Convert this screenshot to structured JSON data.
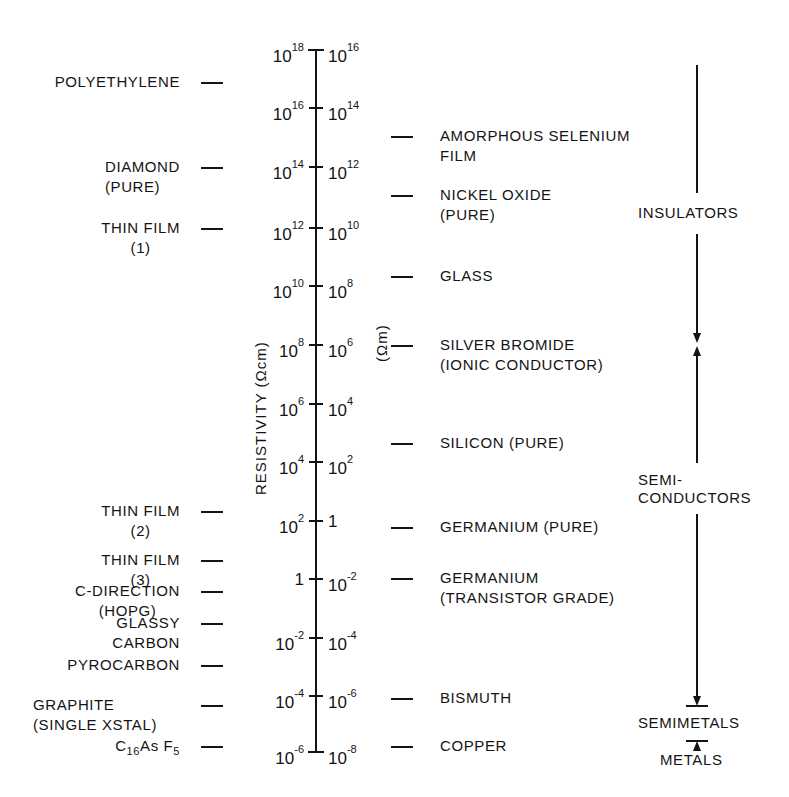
{
  "axis": {
    "title_left": "RESISTIVITY (Ωcm)",
    "title_right": "(Ωm)",
    "ticks": [
      {
        "left": "10",
        "left_exp": "18",
        "right": "10",
        "right_exp": "16",
        "y": 50
      },
      {
        "left": "10",
        "left_exp": "16",
        "right": "10",
        "right_exp": "14",
        "y": 108
      },
      {
        "left": "10",
        "left_exp": "14",
        "right": "10",
        "right_exp": "12",
        "y": 167
      },
      {
        "left": "10",
        "left_exp": "12",
        "right": "10",
        "right_exp": "10",
        "y": 228
      },
      {
        "left": "10",
        "left_exp": "10",
        "right": "10",
        "right_exp": "8",
        "y": 286
      },
      {
        "left": "10",
        "left_exp": "8",
        "right": "10",
        "right_exp": "6",
        "y": 345
      },
      {
        "left": "10",
        "left_exp": "6",
        "right": "10",
        "right_exp": "4",
        "y": 404
      },
      {
        "left": "10",
        "left_exp": "4",
        "right": "10",
        "right_exp": "2",
        "y": 462
      },
      {
        "left": "10",
        "left_exp": "2",
        "right": "1",
        "right_exp": "",
        "y": 521
      },
      {
        "left": "1",
        "left_exp": "",
        "right": "10",
        "right_exp": "-2",
        "y": 579
      },
      {
        "left": "10",
        "left_exp": "-2",
        "right": "10",
        "right_exp": "-4",
        "y": 638
      },
      {
        "left": "10",
        "left_exp": "-4",
        "right": "10",
        "right_exp": "-6",
        "y": 696
      },
      {
        "left": "10",
        "left_exp": "-6",
        "right": "10",
        "right_exp": "-8",
        "y": 752
      }
    ]
  },
  "left_materials": [
    {
      "line1": "POLYETHYLENE",
      "line2": "",
      "y": 82
    },
    {
      "line1": "DIAMOND",
      "line2": "(PURE)",
      "y": 167
    },
    {
      "line1": "THIN FILM",
      "line2": "(1)",
      "y": 228
    },
    {
      "line1": "THIN FILM",
      "line2": "(2)",
      "y": 511
    },
    {
      "line1": "THIN FILM",
      "line2": "(3)",
      "y": 560
    },
    {
      "line1": "C-DIRECTION",
      "line2": "(HOPG)",
      "y": 591
    },
    {
      "line1": "GLASSY",
      "line2": "CARBON",
      "y": 623
    },
    {
      "line1": "PYROCARBON",
      "line2": "",
      "y": 665
    },
    {
      "line1": "GRAPHITE",
      "line2": "(SINGLE XSTAL)",
      "y": 705
    },
    {
      "line1": "C16AsF5",
      "line2": "",
      "y": 746
    }
  ],
  "c16asf5": {
    "c": "C",
    "c_sub": "16",
    "as": "As",
    "f": "F",
    "f_sub": "5"
  },
  "right_materials": [
    {
      "line1": "AMORPHOUS SELENIUM",
      "line2": "FILM",
      "y": 136
    },
    {
      "line1": "NICKEL OXIDE",
      "line2": "(PURE)",
      "y": 195
    },
    {
      "line1": "GLASS",
      "line2": "",
      "y": 276
    },
    {
      "line1": "SILVER BROMIDE",
      "line2": "(IONIC CONDUCTOR)",
      "y": 345
    },
    {
      "line1": "SILICON (PURE)",
      "line2": "",
      "y": 443
    },
    {
      "line1": "GERMANIUM (PURE)",
      "line2": "",
      "y": 527
    },
    {
      "line1": "GERMANIUM",
      "line2": "(TRANSISTOR GRADE)",
      "y": 578
    },
    {
      "line1": "BISMUTH",
      "line2": "",
      "y": 698
    },
    {
      "line1": "COPPER",
      "line2": "",
      "y": 746
    }
  ],
  "classes": {
    "insulators": "INSULATORS",
    "semiconductors_1": "SEMI-",
    "semiconductors_2": "CONDUCTORS",
    "semimetals": "SEMIMETALS",
    "metals": "METALS"
  }
}
